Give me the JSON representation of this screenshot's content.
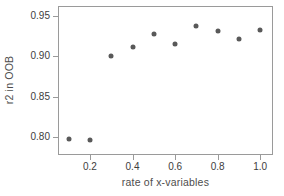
{
  "chart_data": {
    "type": "scatter",
    "title": "",
    "xlabel": "rate of x-variables",
    "ylabel": "r2 in OOB",
    "x": [
      0.1,
      0.2,
      0.3,
      0.4,
      0.5,
      0.6,
      0.7,
      0.8,
      0.9,
      1.0
    ],
    "values": [
      0.797,
      0.796,
      0.901,
      0.912,
      0.928,
      0.916,
      0.938,
      0.932,
      0.922,
      0.933
    ],
    "series": [
      {
        "name": "r2 in OOB",
        "values": [
          0.797,
          0.796,
          0.901,
          0.912,
          0.928,
          0.916,
          0.938,
          0.932,
          0.922,
          0.933
        ]
      }
    ],
    "xlim": [
      0.05,
      1.06
    ],
    "ylim": [
      0.7775,
      0.9625
    ],
    "xticks": [
      0.2,
      0.4,
      0.6,
      0.8,
      1.0
    ],
    "xticklabels": [
      "0.2",
      "0.4",
      "0.6",
      "0.8",
      "1.0"
    ],
    "yticks": [
      0.8,
      0.85,
      0.9,
      0.95
    ],
    "yticklabels": [
      "0.80",
      "0.85",
      "0.90",
      "0.95"
    ],
    "grid": false,
    "legend": null,
    "marker": "circle",
    "marker_color": "#595959",
    "frame_color": "#9a9a9a",
    "background": "#ffffff"
  },
  "axes": {
    "ylabel_text": "r2 in OOB",
    "xlabel_text": "rate of x-variables"
  }
}
